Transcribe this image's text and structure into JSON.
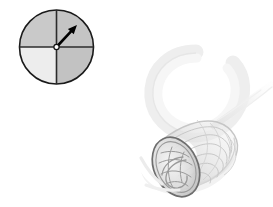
{
  "figure": {
    "title": "Quadrant dial with spiral horn surface",
    "background_color": "#ffffff",
    "width": 273,
    "height": 207
  },
  "dial": {
    "label": "quadrant-dial",
    "center_x": 56.5,
    "center_y": 47,
    "radius": 37,
    "outline_color": "#1a1a1a",
    "outline_width": 1.6,
    "quadrants": [
      {
        "name": "top-left",
        "fill": "#c9c9c9"
      },
      {
        "name": "top-right",
        "fill": "#c4c4c4"
      },
      {
        "name": "bottom-left",
        "fill": "#ededed"
      },
      {
        "name": "bottom-right",
        "fill": "#c2c2c2"
      }
    ],
    "crosshair": {
      "color": "#2b2b2b",
      "width": 1.6,
      "vertical": true,
      "horizontal": true
    },
    "pivot": {
      "fill": "#ffffff",
      "stroke": "#111111",
      "radius": 2.6
    },
    "needle": {
      "name": "direction-arrow",
      "color": "#000000",
      "angle_degrees": 47,
      "length": 30,
      "tip_x": 78,
      "tip_y": 22,
      "shaft_width": 2.6,
      "head_length": 9,
      "head_width": 8
    }
  },
  "horn": {
    "label": "spiral-horn-surface",
    "rim_center_x": 176,
    "rim_center_y": 167,
    "rim_radius_x": 22,
    "rim_radius_y": 31,
    "rim_rotation_degrees": -24,
    "rim_stroke": "#6e6e6e",
    "rim_stroke_width": 1.7,
    "body_fill": "#dedede",
    "wire_color": "#9a9a9a",
    "tail_color": "#efefef",
    "loop_color": "#eeeeee",
    "shadow_color": "#f2f2f2"
  }
}
